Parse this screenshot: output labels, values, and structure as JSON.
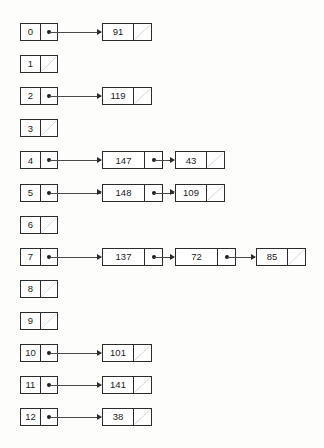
{
  "diagram": {
    "kind": "hash-table-separate-chaining",
    "bucket_count": 13,
    "null_marker": "diagonal-slash",
    "colors": {
      "background": "#fdfdfc",
      "stroke": "#2b2b2b",
      "text": "#1b1b1b",
      "arrow": "#4a4a4a"
    },
    "buckets": [
      {
        "index": "0",
        "empty": false,
        "chain": [
          "91"
        ]
      },
      {
        "index": "1",
        "empty": true,
        "chain": []
      },
      {
        "index": "2",
        "empty": false,
        "chain": [
          "119"
        ]
      },
      {
        "index": "3",
        "empty": true,
        "chain": []
      },
      {
        "index": "4",
        "empty": false,
        "chain": [
          "147",
          "43"
        ]
      },
      {
        "index": "5",
        "empty": false,
        "chain": [
          "148",
          "109"
        ]
      },
      {
        "index": "6",
        "empty": true,
        "chain": []
      },
      {
        "index": "7",
        "empty": false,
        "chain": [
          "137",
          "72",
          "85"
        ]
      },
      {
        "index": "8",
        "empty": true,
        "chain": []
      },
      {
        "index": "9",
        "empty": true,
        "chain": []
      },
      {
        "index": "10",
        "empty": false,
        "chain": [
          "101"
        ]
      },
      {
        "index": "11",
        "empty": false,
        "chain": [
          "141"
        ]
      },
      {
        "index": "12",
        "empty": false,
        "chain": [
          "38"
        ]
      }
    ]
  }
}
